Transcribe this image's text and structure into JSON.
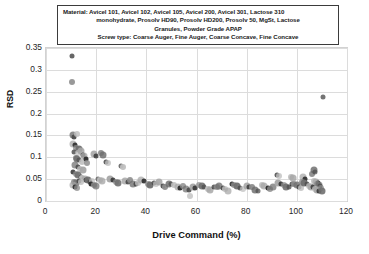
{
  "annotation": {
    "lines": [
      "Material:  Avicel 101, Avicel 102, Avicel 105, Avicel 200, Avicel 301, Lactose 310",
      "monohydrate, Prosolv HD90, Prosolv HD200, Prosolv 50, MgSt, Lactose",
      "Granules, Powder Grade APAP",
      "Screw type: Coarse Auger, Fine Auger, Coarse Concave, Fine Concave"
    ]
  },
  "chart_data": {
    "type": "scatter",
    "title": "",
    "xlabel": "Drive Command  (%)",
    "ylabel": "RSD",
    "xlim": [
      0,
      120
    ],
    "ylim": [
      0,
      0.35
    ],
    "xticks": [
      0,
      20,
      40,
      60,
      80,
      100,
      120
    ],
    "xticklabels": [
      "0",
      "20",
      "40",
      "60",
      "80",
      "100",
      "120"
    ],
    "yticks": [
      0,
      0.05,
      0.1,
      0.15,
      0.2,
      0.25,
      0.3,
      0.35
    ],
    "yticklabels": [
      "0",
      "0.05",
      "0.1",
      "0.15",
      "0.2",
      "0.25",
      "0.3",
      "0.35"
    ],
    "grid": true,
    "legend": "none",
    "marker_colors": [
      "#4d4d4d",
      "#6e6e6e",
      "#8c8c8c",
      "#2b2b2b",
      "#a6a6a6",
      "#bfbfbf"
    ],
    "series": [
      {
        "name": "RSD vs Drive Command",
        "points": [
          [
            10.2,
            0.331
          ],
          [
            10.4,
            0.272
          ],
          [
            10.6,
            0.15
          ],
          [
            11.0,
            0.147
          ],
          [
            12.4,
            0.154
          ],
          [
            10.8,
            0.131
          ],
          [
            11.6,
            0.127
          ],
          [
            12.0,
            0.122
          ],
          [
            13.0,
            0.118
          ],
          [
            11.2,
            0.112
          ],
          [
            12.6,
            0.11
          ],
          [
            13.8,
            0.115
          ],
          [
            14.6,
            0.106
          ],
          [
            11.8,
            0.099
          ],
          [
            12.2,
            0.096
          ],
          [
            13.2,
            0.094
          ],
          [
            14.2,
            0.09
          ],
          [
            15.0,
            0.102
          ],
          [
            15.8,
            0.095
          ],
          [
            16.4,
            0.088
          ],
          [
            11.4,
            0.082
          ],
          [
            12.8,
            0.078
          ],
          [
            13.6,
            0.074
          ],
          [
            14.8,
            0.071
          ],
          [
            10.9,
            0.066
          ],
          [
            11.9,
            0.062
          ],
          [
            12.9,
            0.059
          ],
          [
            13.9,
            0.056
          ],
          [
            14.4,
            0.052
          ],
          [
            15.4,
            0.05
          ],
          [
            16.0,
            0.048
          ],
          [
            11.1,
            0.044
          ],
          [
            12.1,
            0.042
          ],
          [
            13.1,
            0.046
          ],
          [
            14.1,
            0.043
          ],
          [
            10.7,
            0.036
          ],
          [
            11.5,
            0.033
          ],
          [
            12.5,
            0.03
          ],
          [
            16.8,
            0.048
          ],
          [
            17.6,
            0.044
          ],
          [
            18.4,
            0.046
          ],
          [
            19.2,
            0.107
          ],
          [
            19.8,
            0.104
          ],
          [
            22.0,
            0.11
          ],
          [
            22.6,
            0.106
          ],
          [
            20.6,
            0.05
          ],
          [
            21.4,
            0.048
          ],
          [
            22.2,
            0.046
          ],
          [
            18.0,
            0.038
          ],
          [
            19.0,
            0.036
          ],
          [
            20.0,
            0.034
          ],
          [
            23.8,
            0.089
          ],
          [
            24.6,
            0.086
          ],
          [
            25.6,
            0.051
          ],
          [
            26.6,
            0.049
          ],
          [
            27.8,
            0.043
          ],
          [
            28.8,
            0.041
          ],
          [
            30.0,
            0.08
          ],
          [
            30.8,
            0.078
          ],
          [
            31.6,
            0.046
          ],
          [
            32.6,
            0.044
          ],
          [
            33.6,
            0.048
          ],
          [
            34.8,
            0.04
          ],
          [
            35.8,
            0.038
          ],
          [
            36.8,
            0.042
          ],
          [
            38.0,
            0.047
          ],
          [
            39.0,
            0.045
          ],
          [
            40.5,
            0.039
          ],
          [
            41.5,
            0.037
          ],
          [
            43.0,
            0.041
          ],
          [
            44.0,
            0.039
          ],
          [
            45.0,
            0.043
          ],
          [
            46.5,
            0.035
          ],
          [
            47.5,
            0.033
          ],
          [
            49.0,
            0.04
          ],
          [
            50.0,
            0.038
          ],
          [
            51.0,
            0.036
          ],
          [
            52.5,
            0.031
          ],
          [
            53.5,
            0.029
          ],
          [
            54.5,
            0.034
          ],
          [
            56.0,
            0.027
          ],
          [
            57.0,
            0.025
          ],
          [
            57.5,
            0.011
          ],
          [
            58.5,
            0.032
          ],
          [
            59.5,
            0.03
          ],
          [
            61.0,
            0.036
          ],
          [
            62.0,
            0.034
          ],
          [
            63.0,
            0.032
          ],
          [
            64.5,
            0.028
          ],
          [
            65.5,
            0.026
          ],
          [
            67.0,
            0.033
          ],
          [
            68.0,
            0.031
          ],
          [
            69.0,
            0.035
          ],
          [
            70.5,
            0.029
          ],
          [
            71.5,
            0.027
          ],
          [
            72.5,
            0.024
          ],
          [
            74.0,
            0.038
          ],
          [
            75.0,
            0.036
          ],
          [
            76.0,
            0.034
          ],
          [
            77.5,
            0.03
          ],
          [
            78.5,
            0.028
          ],
          [
            80.0,
            0.035
          ],
          [
            81.0,
            0.033
          ],
          [
            82.0,
            0.031
          ],
          [
            83.5,
            0.026
          ],
          [
            84.5,
            0.024
          ],
          [
            86.0,
            0.037
          ],
          [
            87.0,
            0.035
          ],
          [
            88.5,
            0.03
          ],
          [
            89.5,
            0.028
          ],
          [
            90.5,
            0.032
          ],
          [
            92.0,
            0.06
          ],
          [
            93.0,
            0.058
          ],
          [
            92.5,
            0.041
          ],
          [
            93.8,
            0.039
          ],
          [
            94.8,
            0.037
          ],
          [
            95.8,
            0.033
          ],
          [
            96.8,
            0.031
          ],
          [
            97.5,
            0.055
          ],
          [
            98.5,
            0.053
          ],
          [
            98.0,
            0.04
          ],
          [
            99.0,
            0.038
          ],
          [
            100.0,
            0.036
          ],
          [
            100.8,
            0.032
          ],
          [
            101.6,
            0.03
          ],
          [
            102.5,
            0.056
          ],
          [
            103.4,
            0.05
          ],
          [
            102.0,
            0.044
          ],
          [
            103.0,
            0.042
          ],
          [
            104.0,
            0.04
          ],
          [
            104.8,
            0.035
          ],
          [
            105.6,
            0.033
          ],
          [
            106.4,
            0.031
          ],
          [
            106.0,
            0.062
          ],
          [
            106.8,
            0.071
          ],
          [
            107.4,
            0.066
          ],
          [
            107.0,
            0.046
          ],
          [
            107.8,
            0.044
          ],
          [
            108.4,
            0.042
          ],
          [
            108.0,
            0.038
          ],
          [
            108.8,
            0.036
          ],
          [
            109.4,
            0.034
          ],
          [
            107.2,
            0.028
          ],
          [
            108.2,
            0.026
          ],
          [
            109.0,
            0.024
          ],
          [
            109.8,
            0.03
          ],
          [
            110.2,
            0.022
          ],
          [
            110.4,
            0.238
          ]
        ]
      }
    ]
  }
}
